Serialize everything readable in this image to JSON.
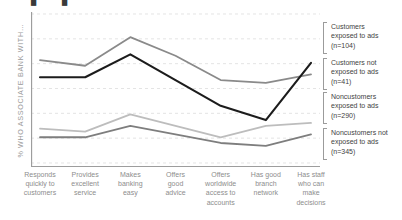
{
  "top_artifact": "▮ ▮",
  "axis": {
    "ylabel": "% WHO ASSOCIATE BANK WITH…"
  },
  "legend": {
    "items": [
      {
        "label_line1": "Customers",
        "label_line2": "exposed to ads",
        "label_line3": "(n=104)"
      },
      {
        "label_line1": "Customers not",
        "label_line2": "exposed to ads",
        "label_line3": "(n=41)"
      },
      {
        "label_line1": "Noncustomers",
        "label_line2": "exposed to ads",
        "label_line3": "(n=290)"
      },
      {
        "label_line1": "Noncustomers not",
        "label_line2": "exposed to ads",
        "label_line3": "(n=345)"
      }
    ]
  },
  "chart_data": {
    "type": "line",
    "title": "",
    "xlabel": "",
    "ylabel": "% WHO ASSOCIATE BANK WITH…",
    "grid": true,
    "grid_lines": 6,
    "legend_position": "right",
    "ylim": [
      0,
      100
    ],
    "categories": [
      "Responds quickly to customers",
      "Provides excellent service",
      "Makes banking easy",
      "Offers good advice",
      "Offers worldwide access to accounts",
      "Has good branch network",
      "Has staff who can make decisions"
    ],
    "categories_wrapped": [
      [
        "Responds",
        "quickly to",
        "customers"
      ],
      [
        "Provides",
        "excellent",
        "service"
      ],
      [
        "Makes",
        "banking",
        "easy"
      ],
      [
        "Offers",
        "good",
        "advice"
      ],
      [
        "Offers",
        "worldwide",
        "access to",
        "accounts"
      ],
      [
        "Has good",
        "branch",
        "network"
      ],
      [
        "Has staff",
        "who can",
        "make",
        "decisions"
      ]
    ],
    "series": [
      {
        "name": "Customers exposed to ads (n=104)",
        "n": 104,
        "color": "#8a8a8a",
        "width": 1.8,
        "values": [
          72,
          68,
          88,
          75,
          58,
          56,
          62
        ]
      },
      {
        "name": "Customers not exposed to ads (n=41)",
        "n": 41,
        "color": "#1c1c1c",
        "width": 2.1,
        "values": [
          60,
          60,
          76,
          58,
          40,
          30,
          70
        ]
      },
      {
        "name": "Noncustomers exposed to ads (n=290)",
        "n": 290,
        "color": "#bdbdbd",
        "width": 1.8,
        "values": [
          24,
          22,
          34,
          26,
          18,
          26,
          28
        ]
      },
      {
        "name": "Noncustomers not exposed to ads (n=345)",
        "n": 345,
        "color": "#7e7e7e",
        "width": 1.8,
        "values": [
          18,
          18,
          26,
          20,
          14,
          12,
          20
        ]
      }
    ]
  },
  "colors": {
    "axis": "#9d9d9d",
    "grid": "#d9d9d9",
    "xlabel_text": "#8d8d8d",
    "ylabel_text": "#9a9a9a",
    "legend_text": "#3f3f3f",
    "background": "#ffffff"
  }
}
